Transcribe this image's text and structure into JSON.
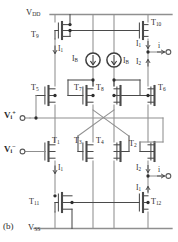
{
  "figure": {
    "panel_label": "(b)",
    "type": "cmos-transconductance-amplifier-schematic",
    "background_color": "#ffffff",
    "wire_color": "#8c8c8c",
    "device_color": "#4a4a4a",
    "text_color": "#2b2b2b"
  },
  "rails": {
    "top": {
      "name": "VDD",
      "symbol": "V",
      "subscript": "DD"
    },
    "bottom": {
      "name": "VSS",
      "symbol": "V",
      "subscript": "SS"
    }
  },
  "inputs": [
    {
      "id": "vi-plus",
      "symbol": "V",
      "subscript": "i",
      "superscript": "+"
    },
    {
      "id": "vi-minus",
      "symbol": "V",
      "subscript": "i",
      "superscript": "−"
    }
  ],
  "transistors": [
    {
      "id": "T9",
      "symbol": "T",
      "subscript": "9"
    },
    {
      "id": "T10",
      "symbol": "T",
      "subscript": "10"
    },
    {
      "id": "T5",
      "symbol": "T",
      "subscript": "5"
    },
    {
      "id": "T7",
      "symbol": "T",
      "subscript": "7"
    },
    {
      "id": "T8",
      "symbol": "T",
      "subscript": "8"
    },
    {
      "id": "T6",
      "symbol": "T",
      "subscript": "6"
    },
    {
      "id": "T1",
      "symbol": "T",
      "subscript": "1"
    },
    {
      "id": "T3",
      "symbol": "T",
      "subscript": "3"
    },
    {
      "id": "T4",
      "symbol": "T",
      "subscript": "4"
    },
    {
      "id": "T2",
      "symbol": "T",
      "subscript": "2"
    },
    {
      "id": "T11",
      "symbol": "T",
      "subscript": "11"
    },
    {
      "id": "T12",
      "symbol": "T",
      "subscript": "12"
    }
  ],
  "currents": [
    {
      "id": "IB-left",
      "symbol": "I",
      "subscript": "B",
      "direction": "down",
      "source": true
    },
    {
      "id": "IB-right",
      "symbol": "I",
      "subscript": "B",
      "direction": "down",
      "source": true
    },
    {
      "id": "I1-topleft",
      "symbol": "I",
      "subscript": "1",
      "direction": "down"
    },
    {
      "id": "I1-topright",
      "symbol": "I",
      "subscript": "1",
      "direction": "down"
    },
    {
      "id": "I2-topright",
      "symbol": "I",
      "subscript": "2",
      "direction": "up"
    },
    {
      "id": "I1-bottomleft",
      "symbol": "I",
      "subscript": "1",
      "direction": "down"
    },
    {
      "id": "I2-bottomright",
      "symbol": "I",
      "subscript": "2",
      "direction": "down"
    },
    {
      "id": "I1-bottomright",
      "symbol": "I",
      "subscript": "1",
      "direction": "up"
    },
    {
      "id": "i-top",
      "symbol": "i",
      "subscript": "",
      "direction": "right",
      "terminal": true
    },
    {
      "id": "i-bottom",
      "symbol": "i",
      "subscript": "",
      "direction": "right",
      "terminal": true
    }
  ]
}
